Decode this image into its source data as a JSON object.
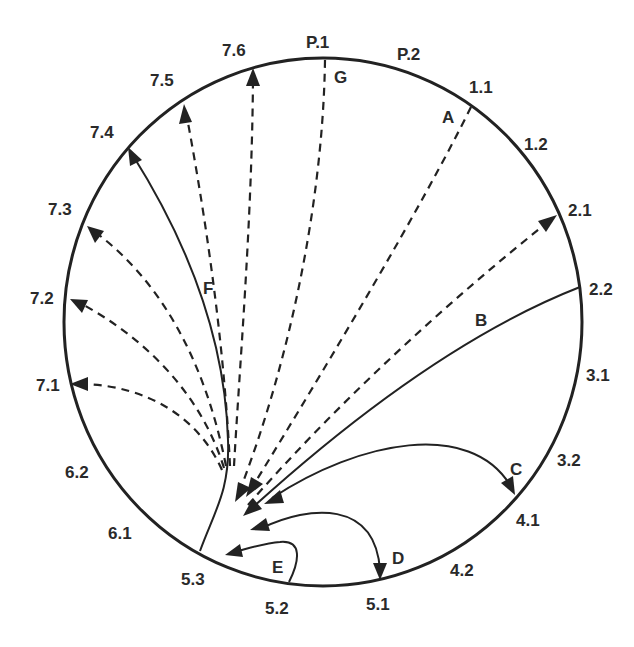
{
  "diagram": {
    "type": "circular-transition-diagram",
    "boundary_labels": {
      "p1": "P.1",
      "p2": "P.2",
      "l11": "1.1",
      "l12": "1.2",
      "l21": "2.1",
      "l22": "2.2",
      "l31": "3.1",
      "l32": "3.2",
      "l41": "4.1",
      "l42": "4.2",
      "l51": "5.1",
      "l52": "5.2",
      "l53": "5.3",
      "l61": "6.1",
      "l62": "6.2",
      "l71": "7.1",
      "l72": "7.2",
      "l73": "7.3",
      "l74": "7.4",
      "l75": "7.5",
      "l76": "7.6"
    },
    "path_labels": {
      "a": "A",
      "b": "B",
      "c": "C",
      "d": "D",
      "e": "E",
      "f": "F",
      "g": "G"
    },
    "paths": [
      {
        "id": "A",
        "from": "5.3",
        "to": "1.1",
        "style": "dashed",
        "direction": "from 1.1 toward 5.3"
      },
      {
        "id": "dashed-2.1",
        "from": "5.3",
        "to": "2.1",
        "style": "dashed",
        "direction": "toward 2.1"
      },
      {
        "id": "B",
        "from": "2.2",
        "to": "5.3",
        "style": "solid",
        "direction": "toward 5.3"
      },
      {
        "id": "C",
        "from": "5.3",
        "to": "4.1",
        "style": "solid",
        "direction": "bidirectional loop between 4.1 and 5.3"
      },
      {
        "id": "D",
        "from": "5.3",
        "to": "5.1",
        "style": "solid",
        "direction": "bidirectional loop between 5.1 and 5.3"
      },
      {
        "id": "E",
        "from": "5.2",
        "to": "5.3",
        "style": "solid",
        "direction": "toward 5.3"
      },
      {
        "id": "F",
        "from": "5.3",
        "to": "7.4",
        "style": "solid",
        "direction": "toward 7.4"
      },
      {
        "id": "G",
        "from": "P.1",
        "to": "5.3",
        "style": "dashed",
        "direction": "toward 5.3"
      },
      {
        "id": "dashed-7.1",
        "from": "5.3",
        "to": "7.1",
        "style": "dashed",
        "direction": "toward 7.1"
      },
      {
        "id": "dashed-7.2",
        "from": "5.3",
        "to": "7.2",
        "style": "dashed",
        "direction": "toward 7.2"
      },
      {
        "id": "dashed-7.3",
        "from": "5.3",
        "to": "7.3",
        "style": "dashed",
        "direction": "toward 7.3"
      },
      {
        "id": "dashed-7.5",
        "from": "5.3",
        "to": "7.5",
        "style": "dashed",
        "direction": "toward 7.5"
      },
      {
        "id": "dashed-7.6",
        "from": "5.3",
        "to": "7.6",
        "style": "dashed",
        "direction": "toward 7.6"
      }
    ]
  }
}
